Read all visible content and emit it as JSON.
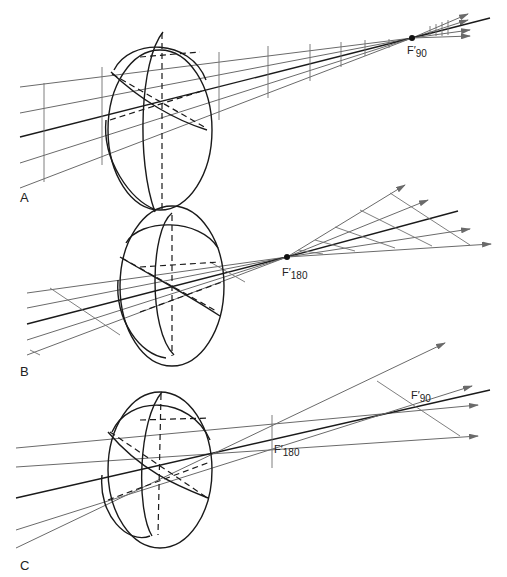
{
  "figure": {
    "type": "optics-diagram",
    "panels": [
      {
        "id": "A",
        "label": "A",
        "focal_point": {
          "prefix": "F′",
          "subscript": "90"
        }
      },
      {
        "id": "B",
        "label": "B",
        "focal_point": {
          "prefix": "F′",
          "subscript": "180"
        }
      },
      {
        "id": "C",
        "label": "C",
        "focal_points": [
          {
            "prefix": "F′",
            "subscript": "90"
          },
          {
            "prefix": "F′",
            "subscript": "180"
          }
        ]
      }
    ],
    "colors": {
      "ray": "#6a6a6a",
      "chief_ray": "#1a1a1a",
      "lens": "#1a1a1a",
      "background": "#ffffff"
    }
  }
}
